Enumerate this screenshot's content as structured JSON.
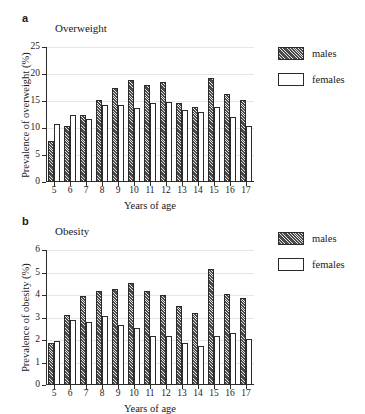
{
  "figure": {
    "background": "#ffffff",
    "bar_fill_males": "#4a4a4a",
    "bar_fill_females": "#ffffff",
    "axis_color": "#2b2b2b",
    "grid_color": "#e6e6e6"
  },
  "panels": [
    {
      "letter": "a",
      "title": "Overweight",
      "legend": {
        "position": "right",
        "items": [
          "males",
          "females"
        ]
      }
    },
    {
      "letter": "b",
      "title": "Obesity",
      "legend": {
        "position": "right",
        "items": [
          "males",
          "females"
        ]
      }
    }
  ],
  "chart_data": [
    {
      "type": "bar",
      "title": "Overweight",
      "panel": "a",
      "xlabel": "Years of age",
      "ylabel": "Prevalence of overweight (%)",
      "categories": [
        "5",
        "6",
        "7",
        "8",
        "9",
        "10",
        "11",
        "12",
        "13",
        "14",
        "15",
        "16",
        "17"
      ],
      "ylim": [
        0,
        25
      ],
      "yticks": [
        0,
        5,
        10,
        15,
        20,
        25
      ],
      "grid": true,
      "legend_position": "right",
      "series": [
        {
          "name": "males",
          "values": [
            7.6,
            10.3,
            12.4,
            15.1,
            17.5,
            18.8,
            18.0,
            18.6,
            14.6,
            13.9,
            19.3,
            16.3,
            15.1
          ]
        },
        {
          "name": "females",
          "values": [
            10.8,
            12.5,
            11.7,
            14.3,
            14.2,
            13.7,
            14.6,
            14.9,
            13.3,
            12.9,
            13.8,
            12.0,
            10.3
          ]
        }
      ]
    },
    {
      "type": "bar",
      "title": "Obesity",
      "panel": "b",
      "xlabel": "Years of age",
      "ylabel": "Prevalence of obesity (%)",
      "categories": [
        "5",
        "6",
        "7",
        "8",
        "9",
        "10",
        "11",
        "12",
        "13",
        "14",
        "15",
        "16",
        "17"
      ],
      "ylim": [
        0,
        6
      ],
      "yticks": [
        0,
        1,
        2,
        3,
        4,
        5,
        6
      ],
      "grid": true,
      "legend_position": "right",
      "series": [
        {
          "name": "males",
          "values": [
            1.85,
            3.12,
            3.96,
            4.2,
            4.25,
            4.52,
            4.16,
            4.0,
            3.52,
            3.18,
            5.15,
            4.05,
            3.85
          ]
        },
        {
          "name": "females",
          "values": [
            1.95,
            2.9,
            2.78,
            3.05,
            2.68,
            2.54,
            2.2,
            2.2,
            1.85,
            1.75,
            2.2,
            2.32,
            2.05
          ]
        }
      ]
    }
  ]
}
